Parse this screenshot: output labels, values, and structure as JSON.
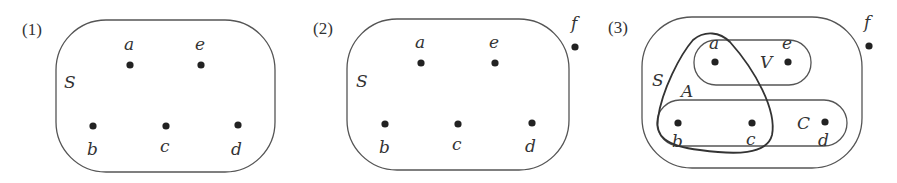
{
  "panels": [
    {
      "number": "(1)",
      "sets": [
        {
          "name": "S",
          "label": "S"
        }
      ],
      "points": [
        {
          "name": "a",
          "label": "a"
        },
        {
          "name": "e",
          "label": "e"
        },
        {
          "name": "b",
          "label": "b"
        },
        {
          "name": "c",
          "label": "c"
        },
        {
          "name": "d",
          "label": "d"
        }
      ]
    },
    {
      "number": "(2)",
      "sets": [
        {
          "name": "S",
          "label": "S"
        }
      ],
      "points": [
        {
          "name": "a",
          "label": "a"
        },
        {
          "name": "e",
          "label": "e"
        },
        {
          "name": "b",
          "label": "b"
        },
        {
          "name": "c",
          "label": "c"
        },
        {
          "name": "d",
          "label": "d"
        },
        {
          "name": "f",
          "label": "f"
        }
      ]
    },
    {
      "number": "(3)",
      "sets": [
        {
          "name": "S",
          "label": "S"
        },
        {
          "name": "A",
          "label": "A"
        },
        {
          "name": "V",
          "label": "V"
        },
        {
          "name": "C",
          "label": "C"
        }
      ],
      "points": [
        {
          "name": "a",
          "label": "a"
        },
        {
          "name": "e",
          "label": "e"
        },
        {
          "name": "b",
          "label": "b"
        },
        {
          "name": "c",
          "label": "c"
        },
        {
          "name": "d",
          "label": "d"
        },
        {
          "name": "f",
          "label": "f"
        }
      ]
    }
  ]
}
